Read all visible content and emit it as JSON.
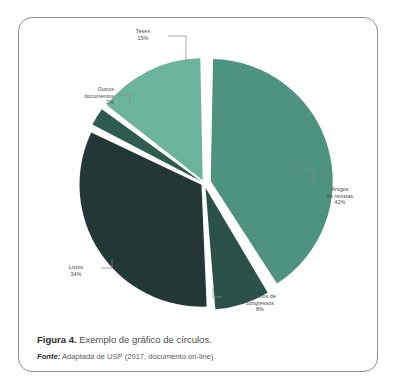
{
  "figure": {
    "caption_label": "Figura 4.",
    "caption_text": " Exemplo de gráfico de círculos.",
    "source_label": "Fonte:",
    "source_text": " Adaptada de USP (2017, documento on-line)."
  },
  "chart_data": {
    "type": "pie",
    "title": "",
    "categories": [
      "Artigos de revistas",
      "Trabalhos de congressos",
      "Livros",
      "Outros documentos",
      "Teses"
    ],
    "values": [
      42,
      8,
      34,
      3,
      15
    ],
    "value_labels": [
      "42%",
      "8%",
      "34%",
      "3%",
      "15%"
    ],
    "colors": [
      "#4e9380",
      "#2a5249",
      "#233836",
      "#2d5b50",
      "#6bb39c"
    ],
    "start_angle_deg": 0,
    "direction": "clockwise",
    "exploded": true,
    "gap_deg": 2.2,
    "legend": "none",
    "grid": false,
    "labels": [
      {
        "name": "Teses",
        "line1": "Teses",
        "line2": "15%"
      },
      {
        "name": "Outros documentos",
        "line1": "Outros",
        "line2": "documentos",
        "line3": "3%"
      },
      {
        "name": "Artigos de revistas",
        "line1": "Artigos",
        "line2": "de revistas",
        "line3": "42%"
      },
      {
        "name": "Livros",
        "line1": "Livros",
        "line2": "34%"
      },
      {
        "name": "Trabalhos de congressos",
        "line1": "Trabalhos de",
        "line2": "congressos",
        "line3": "8%"
      }
    ]
  }
}
